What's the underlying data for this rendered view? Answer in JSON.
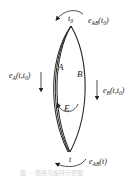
{
  "diagram": {
    "type": "loop-path-diagram",
    "top_point": {
      "label": "t",
      "subscript": "0"
    },
    "bottom_point": {
      "label": "t"
    },
    "paths": [
      {
        "name": "A",
        "label": "A"
      },
      {
        "name": "B",
        "label": "B"
      },
      {
        "name": "E",
        "label": "E"
      }
    ],
    "labels": {
      "top_rotation": "e_AB(t0)",
      "top_rotation_main": "e",
      "top_rotation_sub": "AB",
      "top_rotation_arg": "(t",
      "top_rotation_arg_sub": "0",
      "top_rotation_close": ")",
      "left_transport_main": "e",
      "left_transport_sub": "A",
      "left_transport_arg": "(t,t",
      "left_transport_arg_sub": "0",
      "left_transport_close": ")",
      "right_transport_main": "e",
      "right_transport_sub": "B",
      "right_transport_arg": "(t,t",
      "right_transport_arg_sub": "0",
      "right_transport_close": ")",
      "bottom_rotation_main": "e",
      "bottom_rotation_sub": "AB",
      "bottom_rotation_arg": "(t)"
    },
    "caption": "图 — 路径与旋转示意图",
    "colors": {
      "stroke": "#222222",
      "caption": "#d6d6d6"
    }
  }
}
